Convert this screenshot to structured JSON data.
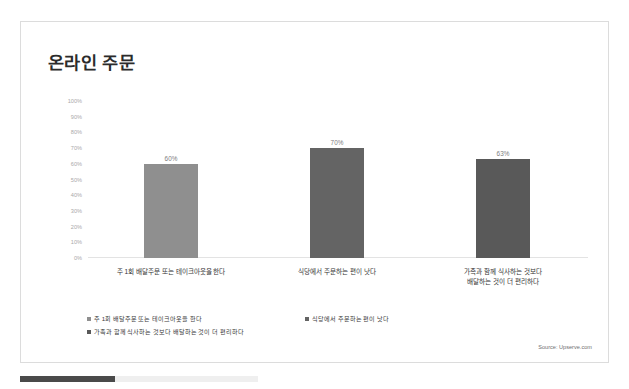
{
  "slide": {
    "title": "온라인 주문",
    "source_note": "Source: Upserve.com"
  },
  "chart_data": {
    "type": "bar",
    "title": "온라인 주문",
    "xlabel": "",
    "ylabel": "",
    "ylim": [
      0,
      100
    ],
    "grid": false,
    "legend_position": "bottom",
    "categories": [
      "주 1회 배달주문 또는 테이크아웃을 한다",
      "식당에서 주문하는 편이 낫다",
      "가족과 함께 식사하는 것보다 배달하는 것이 더 편리하다"
    ],
    "category_lines": [
      [
        "주 1회 배달주문 또는 테이크아웃을 한다"
      ],
      [
        "식당에서 주문하는 편이 낫다"
      ],
      [
        "가족과 함께 식사하는 것보다",
        "배달하는 것이 더 편리하다"
      ]
    ],
    "values": [
      60,
      70,
      63
    ],
    "value_labels": [
      "60%",
      "70%",
      "63%"
    ],
    "bar_colors": [
      "#8f8f8f",
      "#646464",
      "#595959"
    ],
    "ytick_labels": [
      "100%",
      "90%",
      "80%",
      "70%",
      "60%",
      "50%",
      "40%",
      "30%",
      "20%",
      "10%",
      "0%"
    ],
    "ytick_values": [
      100,
      90,
      80,
      70,
      60,
      50,
      40,
      30,
      20,
      10,
      0
    ],
    "legend": [
      {
        "label": "주 1회 배달주문 또는 테이크아웃을 한다",
        "color": "#8f8f8f"
      },
      {
        "label": "식당에서 주문하는 편이 낫다",
        "color": "#646464"
      },
      {
        "label": "가족과 함께 식사하는 것보다 배달하는 것이 더 편리하다",
        "color": "#595959"
      }
    ]
  },
  "bottom_progress": {
    "percent": 40,
    "fill_color": "#4a4a4a",
    "track_color": "#efefef"
  }
}
